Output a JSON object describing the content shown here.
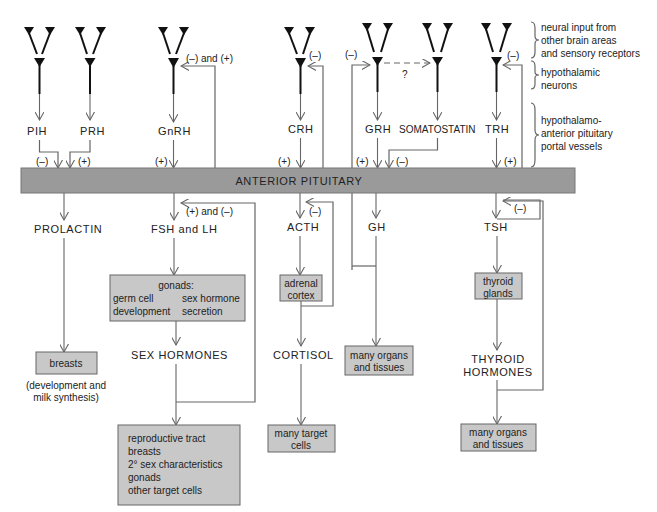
{
  "diagram": {
    "pituitary": "ANTERIOR PITUITARY",
    "colors": {
      "bar": "#9a9a9a",
      "box": "#c8c8c8",
      "line": "#666666"
    },
    "legend": {
      "neural": [
        "neural input from",
        "other brain areas",
        "and sensory receptors"
      ],
      "neurons": [
        "hypothalamic",
        "neurons"
      ],
      "portal": [
        "hypothalamo-",
        "anterior pituitary",
        "portal vessels"
      ]
    },
    "hypothalamic": {
      "pih": "PIH",
      "prh": "PRH",
      "gnrh": "GnRH",
      "crh": "CRH",
      "grh": "GRH",
      "somatostatin": "SOMATOSTATIN",
      "trh": "TRH"
    },
    "signs": {
      "pih": "(–)",
      "prh": "(+)",
      "gnrh": "(+)",
      "crh": "(+)",
      "grh": "(+)",
      "somatostatin": "(–)",
      "trh": "(+)",
      "gnrh_fb": "(–) and (+)",
      "crh_fb": "(–)",
      "grh_fb": "(–)",
      "trh_fb": "(–)",
      "fsh_fb": "(+) and (–)",
      "acth_fb": "(–)",
      "tsh_fb": "(–)",
      "question": "?"
    },
    "pituitary_hormones": {
      "prolactin": "PROLACTIN",
      "fsh_lh": "FSH and LH",
      "acth": "ACTH",
      "gh": "GH",
      "tsh": "TSH"
    },
    "targets": {
      "gonads_title": "gonads:",
      "gonads_left": [
        "germ cell",
        "development"
      ],
      "gonads_right": [
        "sex hormone",
        "secretion"
      ],
      "adrenal": [
        "adrenal",
        "cortex"
      ],
      "thyroid": [
        "thyroid",
        "glands"
      ],
      "breasts": "breasts",
      "breasts_note": [
        "(development and",
        "milk synthesis)"
      ],
      "gh_target": [
        "many organs",
        "and tissues"
      ],
      "cortisol_target": [
        "many target",
        "cells"
      ],
      "thyroid_target": [
        "many organs",
        "and tissues"
      ],
      "sex_target": [
        "reproductive tract",
        "breasts",
        "2° sex characteristics",
        "gonads",
        "other target cells"
      ]
    },
    "secondary_hormones": {
      "sex": "SEX HORMONES",
      "cortisol": "CORTISOL",
      "thyroid": [
        "THYROID",
        "HORMONES"
      ]
    }
  }
}
